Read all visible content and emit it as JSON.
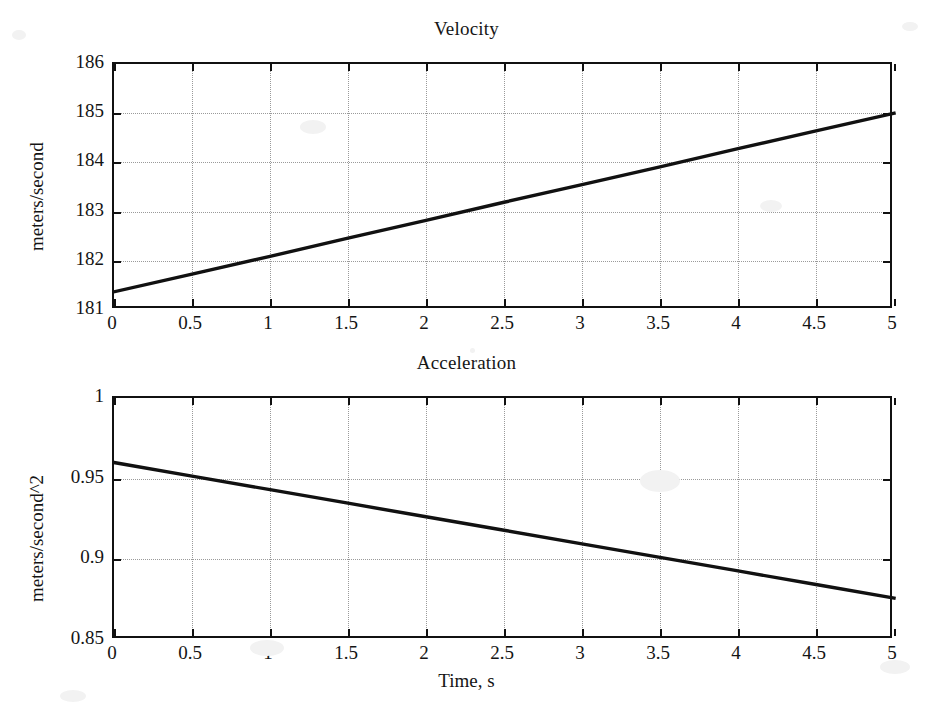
{
  "figure": {
    "width": 933,
    "height": 727,
    "background": "#ffffff",
    "line_color": "#111111",
    "grid_color": "#9a9a9a",
    "axis_color": "#111111"
  },
  "chart_data": [
    {
      "type": "line",
      "title": "Velocity",
      "xlabel": "",
      "ylabel": "meters/second",
      "xlim": [
        0,
        5
      ],
      "ylim": [
        181,
        186
      ],
      "xticks": [
        0,
        0.5,
        1,
        1.5,
        2,
        2.5,
        3,
        3.5,
        4,
        4.5,
        5
      ],
      "xticklabels": [
        "0",
        "0.5",
        "1",
        "1.5",
        "2",
        "2.5",
        "3",
        "3.5",
        "4",
        "4.5",
        "5"
      ],
      "yticks": [
        181,
        182,
        183,
        184,
        185,
        186
      ],
      "yticklabels": [
        "181",
        "182",
        "183",
        "184",
        "185",
        "186"
      ],
      "grid": true,
      "legend": null,
      "series": [
        {
          "name": "velocity",
          "x": [
            0,
            0.5,
            1,
            1.5,
            2,
            2.5,
            3,
            3.5,
            4,
            4.5,
            5
          ],
          "values": [
            181.37,
            181.73,
            182.09,
            182.46,
            182.82,
            183.19,
            183.55,
            183.91,
            184.28,
            184.64,
            185.0
          ]
        }
      ]
    },
    {
      "type": "line",
      "title": "Acceleration",
      "xlabel": "Time, s",
      "ylabel": "meters/second^2",
      "xlim": [
        0,
        5
      ],
      "ylim": [
        0.85,
        1
      ],
      "xticks": [
        0,
        0.5,
        1,
        1.5,
        2,
        2.5,
        3,
        3.5,
        4,
        4.5,
        5
      ],
      "xticklabels": [
        "0",
        "0.5",
        "1",
        "1.5",
        "2",
        "2.5",
        "3",
        "3.5",
        "4",
        "4.5",
        "5"
      ],
      "yticks": [
        0.85,
        0.9,
        0.95,
        1
      ],
      "yticklabels": [
        "0.85",
        "0.9",
        "0.95",
        "1"
      ],
      "grid": true,
      "legend": null,
      "series": [
        {
          "name": "acceleration",
          "x": [
            0,
            0.5,
            1,
            1.5,
            2,
            2.5,
            3,
            3.5,
            4,
            4.5,
            5
          ],
          "values": [
            0.96,
            0.9516,
            0.9432,
            0.9348,
            0.9264,
            0.918,
            0.9096,
            0.9012,
            0.8928,
            0.8844,
            0.876
          ]
        }
      ]
    }
  ]
}
